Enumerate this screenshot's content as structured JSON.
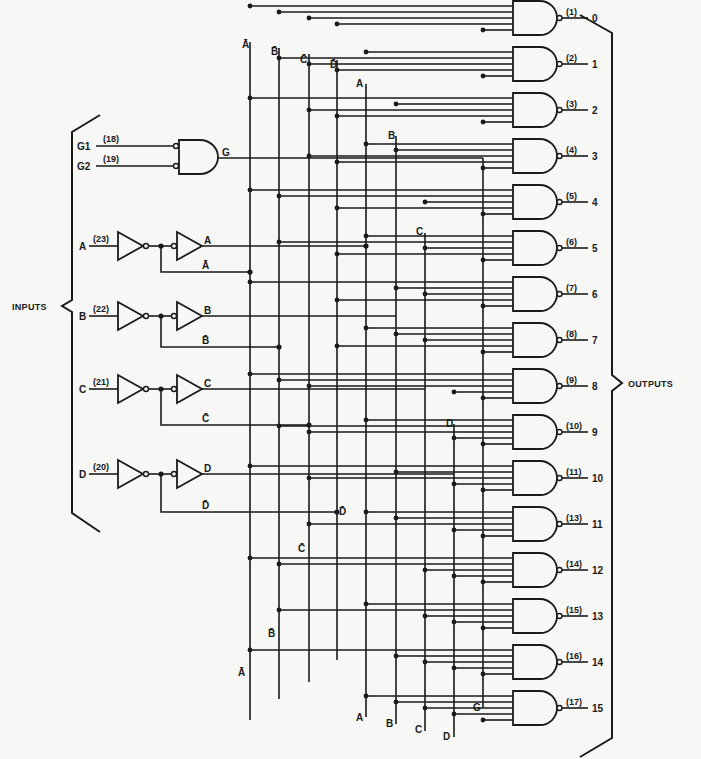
{
  "diagram": {
    "type": "logic-diagram",
    "colors": {
      "ink": "#1a1a1a",
      "paper": "#f7f7f5"
    },
    "inputs_label": "INPUTS",
    "outputs_label": "OUTPUTS",
    "enable": {
      "gate_output_label": "G",
      "inputs": [
        {
          "name": "G1",
          "pin": "(18)"
        },
        {
          "name": "G2",
          "pin": "(19)"
        }
      ]
    },
    "data_inputs": [
      {
        "name": "A",
        "pin": "(23)",
        "true_label": "A",
        "comp_label": "Ā"
      },
      {
        "name": "B",
        "pin": "(22)",
        "true_label": "B",
        "comp_label": "B̄"
      },
      {
        "name": "C",
        "pin": "(21)",
        "true_label": "C",
        "comp_label": "C̄"
      },
      {
        "name": "D",
        "pin": "(20)",
        "true_label": "D",
        "comp_label": "D̄"
      }
    ],
    "buses": [
      {
        "id": "nA",
        "label": "Ā",
        "x": 250
      },
      {
        "id": "nB",
        "label": "B̄",
        "x": 279
      },
      {
        "id": "nC",
        "label": "C̄",
        "x": 309
      },
      {
        "id": "nD",
        "label": "D̄",
        "x": 337
      },
      {
        "id": "A",
        "label": "A",
        "x": 366
      },
      {
        "id": "B",
        "label": "B",
        "x": 396
      },
      {
        "id": "C",
        "label": "C",
        "x": 425
      },
      {
        "id": "D",
        "label": "D",
        "x": 454
      },
      {
        "id": "G",
        "label": "G",
        "x": 483
      }
    ],
    "outputs": [
      {
        "index": "0",
        "pin": "(1)"
      },
      {
        "index": "1",
        "pin": "(2)"
      },
      {
        "index": "2",
        "pin": "(3)"
      },
      {
        "index": "3",
        "pin": "(4)"
      },
      {
        "index": "4",
        "pin": "(5)"
      },
      {
        "index": "5",
        "pin": "(6)"
      },
      {
        "index": "6",
        "pin": "(7)"
      },
      {
        "index": "7",
        "pin": "(8)"
      },
      {
        "index": "8",
        "pin": "(9)"
      },
      {
        "index": "9",
        "pin": "(10)"
      },
      {
        "index": "10",
        "pin": "(11)"
      },
      {
        "index": "11",
        "pin": "(13)"
      },
      {
        "index": "12",
        "pin": "(14)"
      },
      {
        "index": "13",
        "pin": "(15)"
      },
      {
        "index": "14",
        "pin": "(16)"
      },
      {
        "index": "15",
        "pin": "(17)"
      }
    ]
  }
}
